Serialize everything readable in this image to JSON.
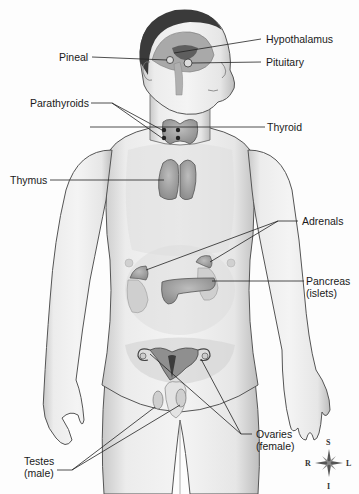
{
  "diagram": {
    "labels": {
      "pineal": "Pineal",
      "hypothalamus": "Hypothalamus",
      "pituitary": "Pituitary",
      "parathyroids": "Parathyroids",
      "thyroid": "Thyroid",
      "thymus": "Thymus",
      "adrenals": "Adrenals",
      "pancreas": "Pancreas\n(islets)",
      "ovaries": "Ovaries\n(female)",
      "testes": "Testes\n(male)"
    },
    "compass": {
      "superior": "S",
      "inferior": "I",
      "right": "R",
      "left": "L"
    }
  }
}
